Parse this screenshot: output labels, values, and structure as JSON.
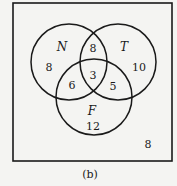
{
  "diagram": {
    "type": "venn",
    "caption": "(b)",
    "sets": [
      {
        "id": "N",
        "label": "N",
        "cx": 69,
        "cy": 62,
        "r": 38
      },
      {
        "id": "T",
        "label": "T",
        "cx": 118,
        "cy": 62,
        "r": 38
      },
      {
        "id": "F",
        "label": "F",
        "cx": 94,
        "cy": 97,
        "r": 38
      }
    ],
    "regions": {
      "N_only": "8",
      "T_only": "10",
      "F_only": "12",
      "N_and_T_only": "8",
      "N_and_F_only": "6",
      "T_and_F_only": "5",
      "N_and_T_and_F": "3",
      "outside": "8"
    },
    "universe_box": {
      "x": 13,
      "y": 3,
      "width": 159,
      "height": 158
    },
    "colors": {
      "stroke": "#1a1a1a",
      "background": "#f4f4f2"
    }
  }
}
